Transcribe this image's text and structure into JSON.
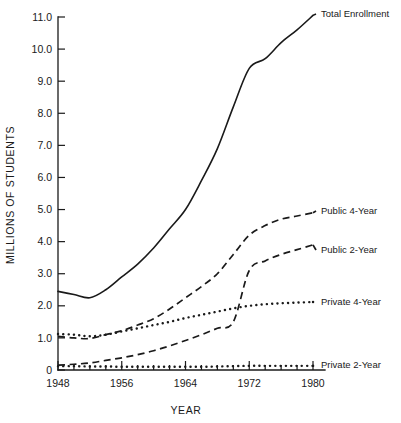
{
  "chart_data": {
    "type": "line",
    "title": "",
    "xlabel": "YEAR",
    "ylabel": "MILLIONS OF STUDENTS",
    "xlim": [
      1948,
      1980
    ],
    "ylim": [
      0,
      11.0
    ],
    "grid": false,
    "legend_position": "right-inline-labels",
    "xticks": [
      1948,
      1956,
      1964,
      1972,
      1980
    ],
    "xtick_labels": [
      "1948",
      "1956",
      "1964",
      "1972",
      "1980"
    ],
    "x_minor_tick_interval": 2,
    "yticks": [
      0,
      1.0,
      2.0,
      3.0,
      4.0,
      5.0,
      6.0,
      7.0,
      8.0,
      9.0,
      10.0,
      11.0
    ],
    "ytick_labels": [
      "0",
      "1.0",
      "2.0",
      "3.0",
      "4.0",
      "5.0",
      "6.0",
      "7.0",
      "8.0",
      "9.0",
      "10.0",
      "11.0"
    ],
    "x": [
      1948,
      1950,
      1952,
      1954,
      1956,
      1958,
      1960,
      1962,
      1964,
      1966,
      1968,
      1970,
      1972,
      1974,
      1976,
      1978,
      1980
    ],
    "series": [
      {
        "name": "Total Enrollment",
        "style": "solid",
        "label": "Total Enrollment",
        "values": [
          2.45,
          2.35,
          2.25,
          2.5,
          2.9,
          3.3,
          3.8,
          4.4,
          5.0,
          5.9,
          6.9,
          8.2,
          9.4,
          9.7,
          10.2,
          10.6,
          11.05
        ]
      },
      {
        "name": "Public 4-Year",
        "style": "dashed",
        "label": "Public 4-Year",
        "values": [
          1.05,
          1.0,
          0.98,
          1.1,
          1.22,
          1.4,
          1.6,
          1.9,
          2.25,
          2.6,
          3.0,
          3.6,
          4.2,
          4.5,
          4.7,
          4.8,
          4.9
        ]
      },
      {
        "name": "Public 2-Year",
        "style": "dashed",
        "label": "Public 2-Year",
        "values": [
          0.15,
          0.18,
          0.22,
          0.3,
          0.38,
          0.48,
          0.6,
          0.75,
          0.92,
          1.1,
          1.3,
          1.5,
          3.1,
          3.4,
          3.6,
          3.75,
          3.9
        ]
      },
      {
        "name": "Private 4-Year",
        "style": "dotted",
        "label": "Private 4-Year",
        "values": [
          1.12,
          1.1,
          1.05,
          1.1,
          1.2,
          1.3,
          1.4,
          1.5,
          1.62,
          1.72,
          1.82,
          1.92,
          2.0,
          2.05,
          2.08,
          2.1,
          2.12
        ]
      },
      {
        "name": "Private 2-Year",
        "style": "dotted",
        "label": "Private 2-Year",
        "values": [
          0.12,
          0.12,
          0.11,
          0.11,
          0.1,
          0.1,
          0.1,
          0.1,
          0.1,
          0.1,
          0.11,
          0.12,
          0.13,
          0.13,
          0.13,
          0.13,
          0.13
        ]
      }
    ],
    "colors": {
      "ink": "#1a1a1a",
      "background": "#ffffff"
    }
  }
}
